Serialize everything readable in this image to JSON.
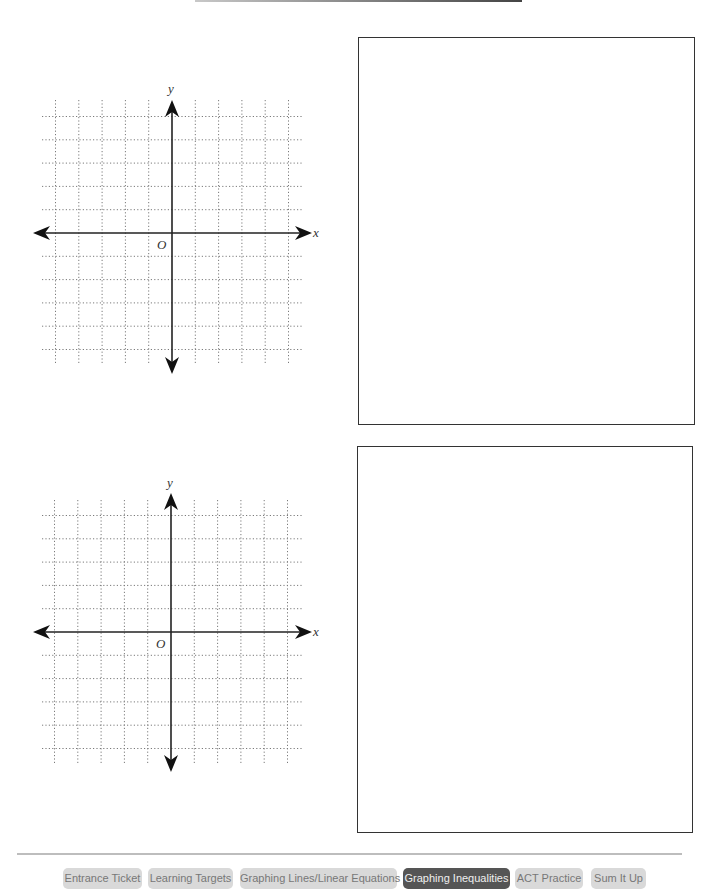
{
  "page": {
    "top_rule": true
  },
  "graphs": [
    {
      "x_label": "x",
      "y_label": "y",
      "origin_label": "O",
      "grid": {
        "columns": 11,
        "rows": 11,
        "style": "dotted"
      }
    },
    {
      "x_label": "x",
      "y_label": "y",
      "origin_label": "O",
      "grid": {
        "columns": 11,
        "rows": 11,
        "style": "dotted"
      }
    }
  ],
  "answer_boxes": [
    {
      "content": ""
    },
    {
      "content": ""
    }
  ],
  "nav": {
    "items": [
      {
        "label": "Entrance Ticket",
        "active": false
      },
      {
        "label": "Learning Targets",
        "active": false
      },
      {
        "label": "Graphing Lines/Linear Equations",
        "active": false
      },
      {
        "label": "Graphing Inequalities",
        "active": true
      },
      {
        "label": "ACT Practice",
        "active": false
      },
      {
        "label": "Sum It Up",
        "active": false
      }
    ]
  },
  "colors": {
    "nav_inactive_bg": "#d9d9d9",
    "nav_inactive_text": "#777777",
    "nav_active_bg": "#555555",
    "nav_active_text": "#efefef",
    "grid_dots": "#777777",
    "axis": "#222222"
  }
}
